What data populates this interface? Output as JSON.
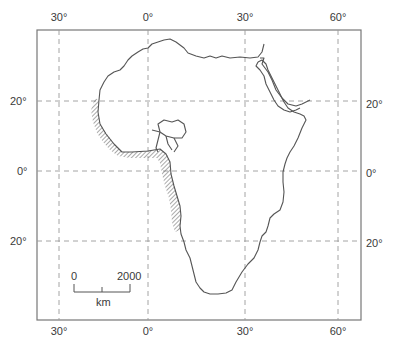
{
  "map": {
    "title": "Africa outline map with graticule",
    "longitude_labels_top": [
      {
        "text": "30°",
        "x": 59
      },
      {
        "text": "0°",
        "x": 148
      },
      {
        "text": "30°",
        "x": 245
      },
      {
        "text": "60°",
        "x": 338
      }
    ],
    "longitude_labels_bottom": [
      {
        "text": "30°",
        "x": 59
      },
      {
        "text": "0°",
        "x": 148
      },
      {
        "text": "30°",
        "x": 245
      },
      {
        "text": "60°",
        "x": 338
      }
    ],
    "latitude_labels_left": [
      {
        "text": "20°",
        "y": 101
      },
      {
        "text": "0°",
        "y": 171
      },
      {
        "text": "20°",
        "y": 241
      }
    ],
    "latitude_labels_right": [
      {
        "text": "20°",
        "y": 101
      },
      {
        "text": "0°",
        "y": 171
      },
      {
        "text": "20°",
        "y": 241
      }
    ],
    "scale_bar": {
      "start_label": "0",
      "end_label": "2000",
      "unit": "km"
    },
    "colors": {
      "frame": "#777777",
      "grid": "#9a9a9a",
      "coast": "#555555",
      "hatch": "#555555",
      "text": "#3a3a3a"
    }
  }
}
